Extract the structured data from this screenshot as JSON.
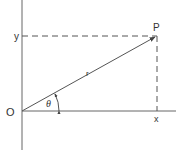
{
  "diagram": {
    "type": "polar-coordinates",
    "labels": {
      "origin": "O",
      "point": "P",
      "y_value": "y",
      "x_value": "x",
      "radius": "r",
      "angle": "θ"
    },
    "colors": {
      "line": "#555555",
      "text": "#333333",
      "background": "#ffffff"
    }
  }
}
